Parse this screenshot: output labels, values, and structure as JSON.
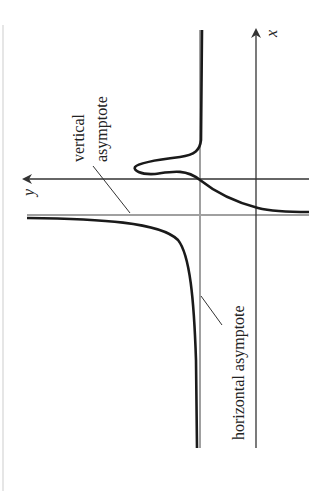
{
  "figure": {
    "rotation_deg": -90,
    "axes": {
      "x_label": "x",
      "y_label": "y"
    },
    "labels": {
      "vertical_line1": "vertical",
      "vertical_line2": "asymptote",
      "horizontal": "horizontal asymptote"
    },
    "colors": {
      "axis": "#333333",
      "asymptote": "#a0a0a0",
      "curve": "#1a1a1a",
      "leader": "#333333"
    }
  }
}
